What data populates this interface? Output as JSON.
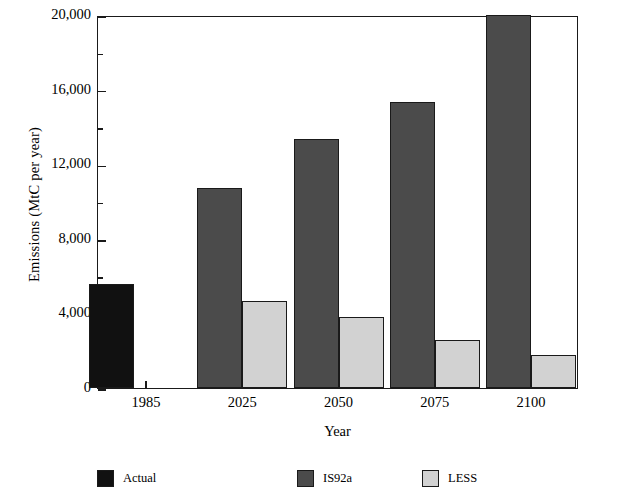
{
  "chart_data": {
    "type": "bar",
    "title": "",
    "xlabel": "Year",
    "ylabel": "Emissions (MtC per year)",
    "categories": [
      "1985",
      "2025",
      "2050",
      "2075",
      "2100"
    ],
    "series": [
      {
        "name": "Actual",
        "color": "#111111",
        "values": [
          5600,
          null,
          null,
          null,
          null
        ]
      },
      {
        "name": "IS92a",
        "color": "#4b4b4b",
        "values": [
          null,
          10700,
          13350,
          15350,
          20000
        ]
      },
      {
        "name": "LESS",
        "color": "#d2d2d2",
        "values": [
          null,
          4650,
          3800,
          2600,
          1750
        ]
      }
    ],
    "ylim": [
      0,
      20000
    ],
    "y_major_ticks": [
      0,
      4000,
      8000,
      12000,
      16000,
      20000
    ],
    "y_tick_labels": [
      "0",
      "4,000",
      "8,000",
      "12,000",
      "16,000",
      "20,000"
    ],
    "y_minor_ticks": [
      2000,
      6000,
      10000,
      14000,
      18000
    ],
    "grid": false,
    "legend_position": "bottom"
  },
  "axes": {
    "y_title": "Emissions (MtC per year)",
    "x_title": "Year"
  },
  "legend": {
    "items": [
      {
        "label": "Actual",
        "color": "#111111"
      },
      {
        "label": "IS92a",
        "color": "#4b4b4b"
      },
      {
        "label": "LESS",
        "color": "#d2d2d2"
      }
    ]
  }
}
